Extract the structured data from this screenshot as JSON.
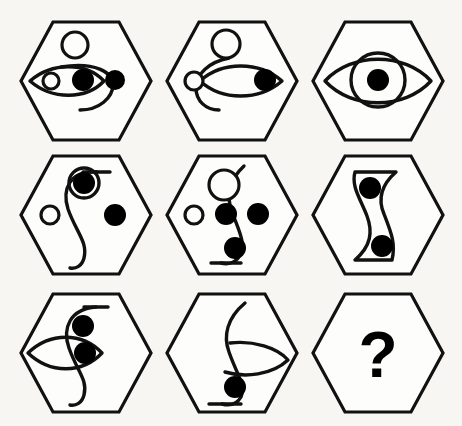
{
  "figure": {
    "kind": "abstract-reasoning-matrix",
    "rows": 3,
    "columns": 3,
    "background_color": "#f7f6f3",
    "line_color": "#111111",
    "fill_color": "#000000",
    "missing_cell_label": "?"
  },
  "layout": {
    "cell_width": 146,
    "cell_height": 140,
    "hex_half_width": 65,
    "hex_half_height": 59,
    "hex_flat_inset": 33,
    "origin_x": 86,
    "origin_y": 81
  },
  "cells": [
    {
      "index": 1,
      "row": 1,
      "column": 1,
      "name": "cell-r1c1",
      "center_x": 86,
      "center_y": 81,
      "elements": [
        "open-circle-top",
        "c-curve",
        "lens-pointing-left",
        "small-open-circle-in-lens",
        "filled-dot-center",
        "filled-dot-right"
      ],
      "filled_dot_count": 2,
      "open_circle_count": 2,
      "has_lens": true,
      "has_curve": true
    },
    {
      "index": 2,
      "row": 1,
      "column": 2,
      "name": "cell-r1c2",
      "center_x": 232,
      "center_y": 81,
      "elements": [
        "open-circle-top",
        "c-curve",
        "small-open-circle-left",
        "lens-pointing-right",
        "filled-dot-in-lens"
      ],
      "filled_dot_count": 1,
      "open_circle_count": 2,
      "has_lens": true,
      "has_curve": true
    },
    {
      "index": 3,
      "row": 1,
      "column": 3,
      "name": "cell-r1c3",
      "center_x": 378,
      "center_y": 81,
      "elements": [
        "wide-lens-eye",
        "large-open-circle-overlap",
        "filled-dot-pupil"
      ],
      "filled_dot_count": 1,
      "open_circle_count": 1,
      "has_lens": true,
      "has_curve": false
    },
    {
      "index": 4,
      "row": 2,
      "column": 1,
      "name": "cell-r2c1",
      "center_x": 86,
      "center_y": 215,
      "elements": [
        "s-curve",
        "ring-with-filled-dot-top",
        "small-open-circle-left",
        "filled-dot-right"
      ],
      "filled_dot_count": 2,
      "open_circle_count": 2,
      "has_lens": false,
      "has_curve": true
    },
    {
      "index": 5,
      "row": 2,
      "column": 2,
      "name": "cell-r2c2",
      "center_x": 232,
      "center_y": 215,
      "elements": [
        "s-curve",
        "open-circle-top",
        "small-open-circle-left",
        "filled-dot-mid-left",
        "filled-dot-mid-right",
        "filled-dot-bottom"
      ],
      "filled_dot_count": 3,
      "open_circle_count": 2,
      "has_lens": false,
      "has_curve": true
    },
    {
      "index": 6,
      "row": 2,
      "column": 3,
      "name": "cell-r2c3",
      "center_x": 378,
      "center_y": 215,
      "elements": [
        "double-s-ribbon",
        "filled-dot-top",
        "filled-dot-bottom"
      ],
      "filled_dot_count": 2,
      "open_circle_count": 0,
      "has_lens": false,
      "has_curve": true
    },
    {
      "index": 7,
      "row": 3,
      "column": 1,
      "name": "cell-r3c1",
      "center_x": 86,
      "center_y": 353,
      "elements": [
        "s-curve",
        "lens-pointing-left",
        "filled-dot-top",
        "filled-dot-middle"
      ],
      "filled_dot_count": 2,
      "open_circle_count": 0,
      "has_lens": true,
      "has_curve": true
    },
    {
      "index": 8,
      "row": 3,
      "column": 2,
      "name": "cell-r3c2",
      "center_x": 232,
      "center_y": 353,
      "elements": [
        "s-curve",
        "lens-pointing-right",
        "filled-dot-bottom"
      ],
      "filled_dot_count": 1,
      "open_circle_count": 0,
      "has_lens": true,
      "has_curve": true
    },
    {
      "index": 9,
      "row": 3,
      "column": 3,
      "name": "cell-r3c3",
      "center_x": 378,
      "center_y": 353,
      "elements": [
        "question-mark"
      ],
      "filled_dot_count": 0,
      "open_circle_count": 0,
      "has_lens": false,
      "has_curve": false,
      "is_answer_slot": true,
      "label": "?"
    }
  ]
}
